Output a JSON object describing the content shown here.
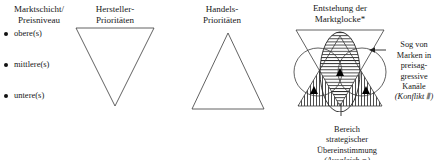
{
  "columns": {
    "market_layer": {
      "heading": "Marktschicht/\nPreisniveau",
      "items": [
        {
          "label": "obere(s)"
        },
        {
          "label": "mittlere(s)"
        },
        {
          "label": "untere(s)"
        }
      ]
    },
    "manufacturer": {
      "heading": "Hersteller-\nPrioritäten",
      "shape": "inverted-triangle"
    },
    "trade": {
      "heading": "Handels-\nPrioritäten",
      "shape": "upright-triangle"
    },
    "market_bell": {
      "heading": "Entstehung der\nMarktglocke*",
      "shape": "overlay-bell"
    }
  },
  "annotations": {
    "pull_note": {
      "lines": "Sog von\nMarken in\npreisag-\ngressive\nKanäle",
      "legend": "(Konflikt ⦀)"
    },
    "alignment_note": {
      "lines": "Bereich\nstrategischer\nÜbereinstimmung",
      "legend": "(Ausgleich ≡)"
    }
  },
  "colors": {
    "ink": "#1a1a1a",
    "stroke": "#3a3a3a",
    "marker": "#000000",
    "background": "#ffffff"
  },
  "icons": {
    "bullet": "bullet-dot-icon",
    "arrow": "leader-arrow-icon",
    "marker": "solid-triangle-marker-icon"
  }
}
